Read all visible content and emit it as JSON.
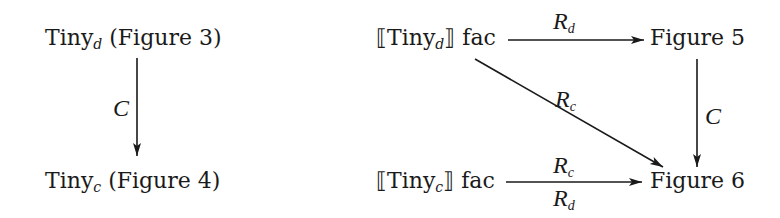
{
  "left_diagram": {
    "top_node": {
      "base": "Tiny",
      "subscript": "d",
      "suffix": " (Figure 3)"
    },
    "bottom_node": {
      "base": "Tiny",
      "subscript": "c",
      "suffix": " (Figure 4)"
    },
    "vertical_arrow_label": "C"
  },
  "right_diagram": {
    "top_left_node": {
      "open": "⟦",
      "base": "Tiny",
      "subscript": "d",
      "close": "⟧",
      "suffix": " fac"
    },
    "top_right_node": "Figure 5",
    "bottom_left_node": {
      "open": "⟦",
      "base": "Tiny",
      "subscript": "c",
      "close": "⟧",
      "suffix": " fac"
    },
    "bottom_right_node": "Figure 6",
    "top_arrow_label": {
      "base": "R",
      "subscript": "d"
    },
    "diagonal_arrow_label": {
      "base": "R",
      "subscript": "c"
    },
    "right_vertical_arrow_label": "C",
    "bottom_arrow_label_above": {
      "base": "R",
      "subscript": "c"
    },
    "bottom_arrow_label_below": {
      "base": "R",
      "subscript": "d"
    }
  },
  "colors": {
    "ink": "#1a1a1a",
    "background": "#ffffff"
  }
}
